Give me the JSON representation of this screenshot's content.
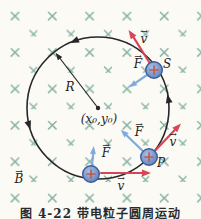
{
  "figure": {
    "caption": "图 4-22  带电粒子圆周运动",
    "labels": {
      "radius": "R",
      "center": "(x₀,y₀)",
      "point_s": "S",
      "point_p": "P",
      "field": "B",
      "velocity": "v",
      "force": "F"
    },
    "glyphs": {
      "vector_arrow": "→",
      "field_marker": "×",
      "charge_sign": "+"
    },
    "colors": {
      "background": "#fbfaf5",
      "marker": "#85b2a4",
      "stroke": "#26262b",
      "velocity": "#d84557",
      "force": "#7fabdc",
      "particle": "#6e91cc",
      "particle-rim": "#3d5c9a",
      "plus": "#c05a4c",
      "text": "#1e1e24"
    }
  }
}
